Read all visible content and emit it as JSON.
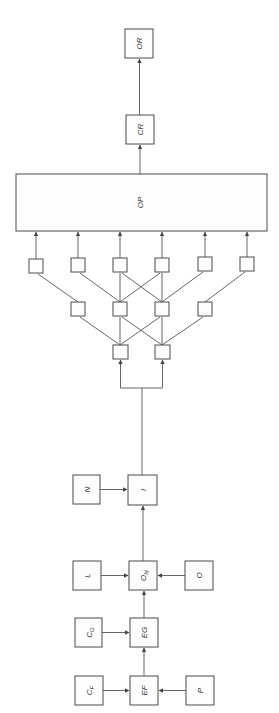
{
  "diagram": {
    "orientation": "rotated-90",
    "labels": {
      "OR": "OR",
      "CR": "CR",
      "OP": "OP",
      "N": "N",
      "I": "I",
      "L": "L",
      "Obj_main": "O",
      "Obj_sub": "bj",
      "O": "O",
      "CG_main": "C",
      "CG_sub": "G",
      "EG": "EG",
      "CF_main": "C",
      "CF_sub": "F",
      "EF": "EF",
      "P": "P"
    },
    "network": {
      "top_row_count": 6,
      "middle_row_count": 4,
      "bottom_row_count": 2
    },
    "colors": {
      "line": "#555555",
      "box_border": "#4a4a4a",
      "text": "#333333"
    }
  }
}
